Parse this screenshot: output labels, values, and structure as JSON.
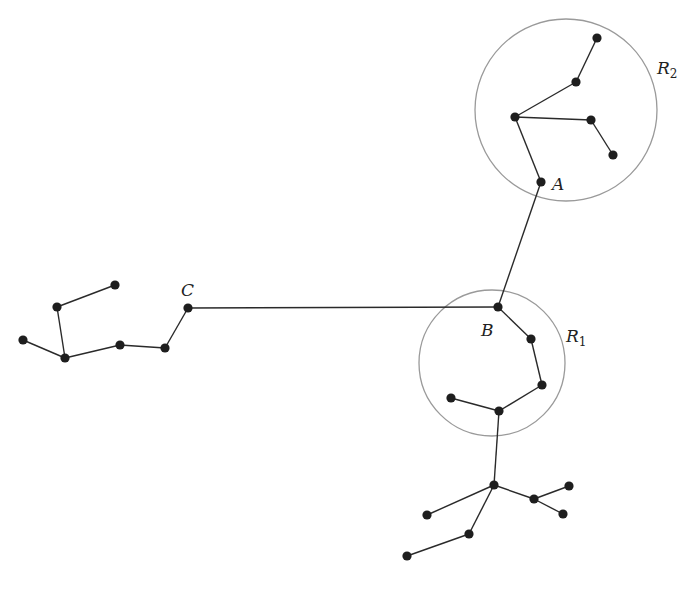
{
  "diagram": {
    "type": "graph-tree",
    "colors": {
      "edge": "#2a2a2a",
      "node": "#1e1e1e",
      "circle": "#9a9a9a",
      "background": "#ffffff"
    },
    "nodes": [
      {
        "id": "r2a",
        "x": 597,
        "y": 38
      },
      {
        "id": "r2b",
        "x": 576,
        "y": 82
      },
      {
        "id": "r2c",
        "x": 515,
        "y": 117
      },
      {
        "id": "r2d",
        "x": 591,
        "y": 120
      },
      {
        "id": "r2e",
        "x": 613,
        "y": 155
      },
      {
        "id": "A",
        "x": 541,
        "y": 182
      },
      {
        "id": "B",
        "x": 498,
        "y": 307
      },
      {
        "id": "r1a",
        "x": 531,
        "y": 339
      },
      {
        "id": "r1b",
        "x": 542,
        "y": 385
      },
      {
        "id": "r1c",
        "x": 451,
        "y": 398
      },
      {
        "id": "r1d",
        "x": 499,
        "y": 411
      },
      {
        "id": "b1",
        "x": 494,
        "y": 485
      },
      {
        "id": "b2",
        "x": 427,
        "y": 515
      },
      {
        "id": "b3",
        "x": 534,
        "y": 499
      },
      {
        "id": "b4",
        "x": 569,
        "y": 486
      },
      {
        "id": "b5",
        "x": 563,
        "y": 514
      },
      {
        "id": "b6",
        "x": 469,
        "y": 534
      },
      {
        "id": "b7",
        "x": 407,
        "y": 556
      },
      {
        "id": "C",
        "x": 188,
        "y": 308
      },
      {
        "id": "l1",
        "x": 165,
        "y": 348
      },
      {
        "id": "l2",
        "x": 120,
        "y": 345
      },
      {
        "id": "l3",
        "x": 65,
        "y": 358
      },
      {
        "id": "l4",
        "x": 23,
        "y": 340
      },
      {
        "id": "l5",
        "x": 57,
        "y": 307
      },
      {
        "id": "l6",
        "x": 115,
        "y": 285
      }
    ],
    "edges": [
      [
        "r2a",
        "r2b"
      ],
      [
        "r2b",
        "r2c"
      ],
      [
        "r2c",
        "r2d"
      ],
      [
        "r2d",
        "r2e"
      ],
      [
        "r2c",
        "A"
      ],
      [
        "A",
        "B"
      ],
      [
        "B",
        "C"
      ],
      [
        "B",
        "r1a"
      ],
      [
        "r1a",
        "r1b"
      ],
      [
        "r1b",
        "r1d"
      ],
      [
        "r1c",
        "r1d"
      ],
      [
        "r1d",
        "b1"
      ],
      [
        "b1",
        "b2"
      ],
      [
        "b1",
        "b3"
      ],
      [
        "b3",
        "b4"
      ],
      [
        "b3",
        "b5"
      ],
      [
        "b1",
        "b6"
      ],
      [
        "b6",
        "b7"
      ],
      [
        "C",
        "l1"
      ],
      [
        "l1",
        "l2"
      ],
      [
        "l2",
        "l3"
      ],
      [
        "l3",
        "l4"
      ],
      [
        "l3",
        "l5"
      ],
      [
        "l5",
        "l6"
      ]
    ],
    "regions": [
      {
        "name": "R2",
        "cx": 566,
        "cy": 110,
        "r": 91
      },
      {
        "name": "R1",
        "cx": 492,
        "cy": 363,
        "r": 73
      }
    ],
    "labels": {
      "A": {
        "text": "A",
        "x": 552,
        "y": 190
      },
      "B": {
        "text": "B",
        "x": 481,
        "y": 336
      },
      "C": {
        "text": "C",
        "x": 181,
        "y": 296
      },
      "R1": {
        "text": "R",
        "sub": "1",
        "x": 566,
        "y": 342
      },
      "R2": {
        "text": "R",
        "sub": "2",
        "x": 657,
        "y": 74
      }
    }
  }
}
